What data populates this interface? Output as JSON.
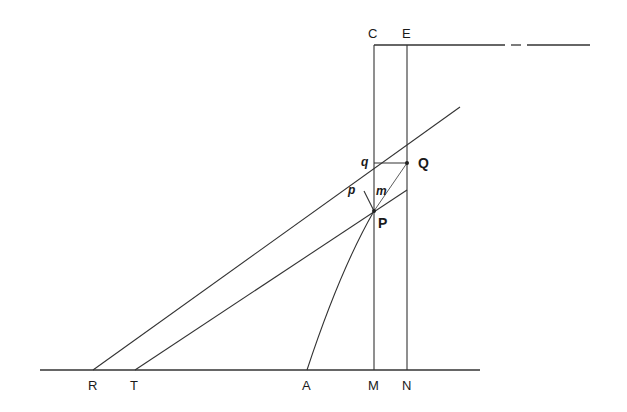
{
  "diagram": {
    "type": "geometric construction",
    "stroke_color": "#333333",
    "points": {
      "R": {
        "label": "R",
        "x": 93,
        "y": 370
      },
      "T": {
        "label": "T",
        "x": 135,
        "y": 370
      },
      "A": {
        "label": "A",
        "x": 307,
        "y": 370
      },
      "M": {
        "label": "M",
        "x": 374,
        "y": 370
      },
      "N": {
        "label": "N",
        "x": 407,
        "y": 370
      },
      "C": {
        "label": "C",
        "x": 374,
        "y": 45
      },
      "E": {
        "label": "E",
        "x": 407,
        "y": 45
      },
      "P": {
        "label": "P",
        "x": 374,
        "y": 211
      },
      "Q": {
        "label": "Q",
        "x": 407,
        "y": 163
      },
      "q": {
        "label": "q",
        "x": 374,
        "y": 163
      },
      "p": {
        "label": "p",
        "x": 364,
        "y": 191
      },
      "m": {
        "label": "m",
        "x": 374,
        "y": 184
      }
    },
    "labels": {
      "R": "R",
      "T": "T",
      "A": "A",
      "M": "M",
      "N": "N",
      "C": "C",
      "E": "E",
      "P": "P",
      "Q": "Q",
      "q": "q",
      "p": "p",
      "m": "m"
    },
    "segments": [
      {
        "name": "baseline",
        "from": [
          40,
          370
        ],
        "to": [
          480,
          370
        ]
      },
      {
        "name": "line-CM",
        "from": [
          374,
          45
        ],
        "to": [
          374,
          370
        ]
      },
      {
        "name": "line-EN",
        "from": [
          407,
          45
        ],
        "to": [
          407,
          370
        ]
      },
      {
        "name": "top-line",
        "from": [
          374,
          45
        ],
        "to": [
          505,
          45
        ]
      },
      {
        "name": "top-dash",
        "from": [
          511,
          45
        ],
        "to": [
          521,
          45
        ]
      },
      {
        "name": "top-line-end",
        "from": [
          527,
          45
        ],
        "to": [
          590,
          45
        ]
      },
      {
        "name": "tangent-RQ",
        "from": [
          93,
          370
        ],
        "to": [
          460,
          107
        ]
      },
      {
        "name": "tangent-TP",
        "from": [
          135,
          370
        ],
        "to": [
          407,
          190
        ]
      },
      {
        "name": "segment-qQ",
        "from": [
          374,
          163
        ],
        "to": [
          407,
          163
        ]
      },
      {
        "name": "segment-pP",
        "from": [
          364,
          191
        ],
        "to": [
          374,
          211
        ]
      },
      {
        "name": "chord-PQ",
        "from": [
          374,
          211
        ],
        "to": [
          407,
          163
        ]
      }
    ],
    "curves": [
      {
        "name": "curve-AP",
        "d": "M307,370 Q340,270 374,211"
      }
    ]
  }
}
